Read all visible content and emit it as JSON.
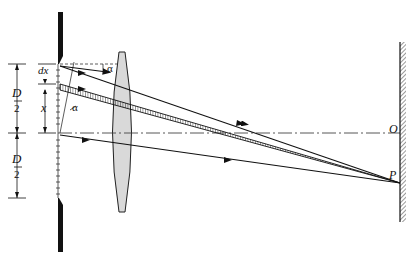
{
  "diagram": {
    "type": "optics-diffraction-single-slit-lens",
    "labels": {
      "dx": "dx",
      "x": "x",
      "alpha_top": "α",
      "alpha_slit": "α",
      "D_top": "D",
      "D_top_den": "2",
      "D_bottom": "D",
      "D_bottom_den": "2",
      "O": "O",
      "P": "P"
    },
    "colors": {
      "ink": "#111111",
      "lens_fill": "#d9d9d9",
      "background": "#ffffff"
    }
  }
}
